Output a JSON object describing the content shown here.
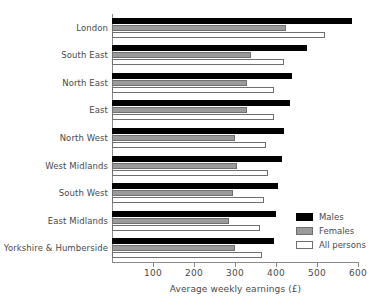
{
  "chart_data": {
    "type": "bar",
    "orientation": "horizontal",
    "title": "",
    "xlabel": "Average weekly earnings (£)",
    "ylabel": "",
    "xlim": [
      0,
      600
    ],
    "xticks": [
      100,
      200,
      300,
      400,
      500,
      600
    ],
    "grid": false,
    "legend_position": "bottom-right",
    "categories": [
      "London",
      "South East",
      "North East",
      "East",
      "North West",
      "West Midlands",
      "South West",
      "East Midlands",
      "Yorkshire & Humberside"
    ],
    "series": [
      {
        "name": "Males",
        "color": "#000000",
        "values": [
          585,
          475,
          440,
          435,
          420,
          415,
          405,
          400,
          395
        ]
      },
      {
        "name": "Females",
        "color": "#9a9a9a",
        "values": [
          425,
          340,
          330,
          330,
          300,
          305,
          295,
          285,
          300
        ]
      },
      {
        "name": "All persons",
        "color": "#ffffff",
        "values": [
          520,
          420,
          395,
          395,
          375,
          380,
          370,
          360,
          365
        ]
      }
    ]
  },
  "axis": {
    "x_title": "Average weekly earnings (£)",
    "tick_labels": [
      "100",
      "200",
      "300",
      "400",
      "500",
      "600"
    ]
  },
  "legend": {
    "items": [
      {
        "label": "Males",
        "swatch": "males-swatch"
      },
      {
        "label": "Females",
        "swatch": "females-swatch"
      },
      {
        "label": "All persons",
        "swatch": "all-persons-swatch"
      }
    ]
  }
}
